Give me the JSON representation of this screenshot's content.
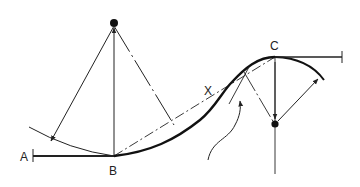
{
  "diagram": {
    "type": "transition curve geometry",
    "labels": {
      "a": "A",
      "b": "B",
      "x": "X",
      "c": "C"
    },
    "colors": {
      "line": "#222222",
      "background": "#ffffff"
    }
  }
}
